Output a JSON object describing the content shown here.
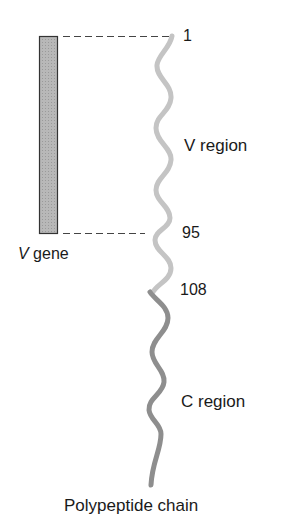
{
  "diagram": {
    "gene_label_italic": "V",
    "gene_label_rest": " gene",
    "chain_title": "Polypeptide chain",
    "positions": {
      "start": "1",
      "v_end": "95",
      "c_start": "108"
    },
    "regions": {
      "v": "V region",
      "c": "C region"
    },
    "colors": {
      "gene_fill": "#b5b5b5",
      "gene_border": "#333333",
      "v_region": "#c4c4c4",
      "c_region": "#8e8e8e",
      "dash": "#444444",
      "text": "#1a1a1a"
    }
  }
}
